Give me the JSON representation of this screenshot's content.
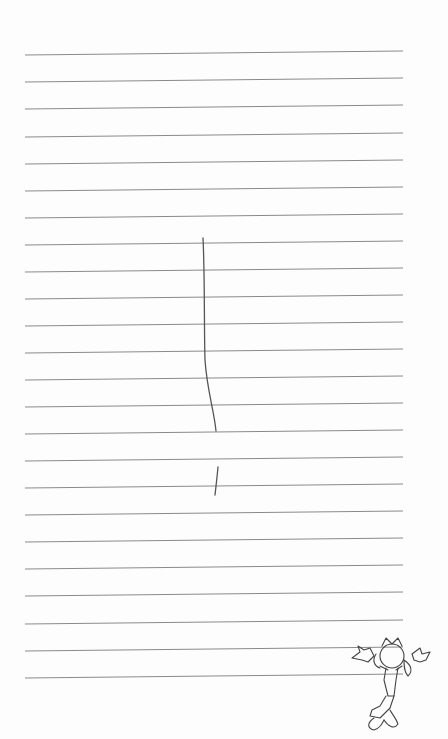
{
  "image": {
    "description": "Lined notebook paper with a hand-drawn vertical pencil stroke and a small cartoon character doodle in the bottom-right corner",
    "paper_color": "#fdfdfd",
    "rule_color": "#8a8a8a",
    "pencil_color": "#555555",
    "rule_count": 24,
    "rules_left_y": [
      55,
      82,
      109,
      137,
      164,
      191,
      218,
      245,
      272,
      299,
      326,
      353,
      380,
      407,
      434,
      461,
      488,
      515,
      542,
      569,
      596,
      624,
      651,
      678
    ],
    "rule_x_start": 25,
    "rule_x_end": 403,
    "rule_rise": 4
  },
  "strokes": [
    {
      "name": "long-vertical-stroke",
      "path": "M203,238 C205,280 204,330 205,360 C207,390 214,410 216,431"
    },
    {
      "name": "short-stroke",
      "path": "M218,467 C217,478 216,486 215,495"
    }
  ],
  "doodle": {
    "name": "cartoon-character",
    "x": 355,
    "y": 640
  }
}
